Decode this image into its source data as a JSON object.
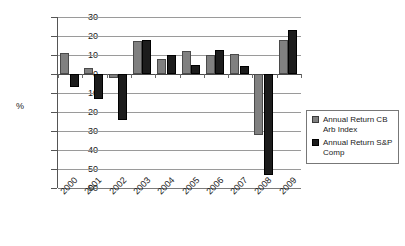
{
  "chart_data": {
    "type": "bar",
    "title": "",
    "xlabel": "",
    "ylabel": "%",
    "categories": [
      "2000",
      "2001",
      "2002",
      "2003",
      "2004",
      "2005",
      "2006",
      "2007",
      "2008",
      "2009"
    ],
    "ylim": [
      -60,
      30
    ],
    "ytick_labels": [
      "30",
      "20",
      "10",
      "0",
      "10",
      "20",
      "30",
      "40",
      "50",
      "60"
    ],
    "ytick_values": [
      30,
      20,
      10,
      0,
      -10,
      -20,
      -30,
      -40,
      -50,
      -60
    ],
    "grid": true,
    "legend_position": "right",
    "series": [
      {
        "name": "Annual Return CB Arb Index",
        "color": "#808080",
        "values": [
          11,
          3,
          -2,
          17.5,
          8,
          12,
          10,
          10.5,
          -32,
          18
        ]
      },
      {
        "name": "Annual Return S&P Comp",
        "color": "#1c1c1c",
        "values": [
          -7,
          -13,
          -24,
          18,
          10,
          4.5,
          12.5,
          4,
          -53,
          23
        ]
      }
    ]
  },
  "legend": {
    "entries": [
      {
        "label_line1": "Annual Return CB",
        "label_line2": "Arb Index"
      },
      {
        "label_line1": "Annual Return S&P",
        "label_line2": "Comp"
      }
    ]
  },
  "axis": {
    "y_label": "%"
  }
}
